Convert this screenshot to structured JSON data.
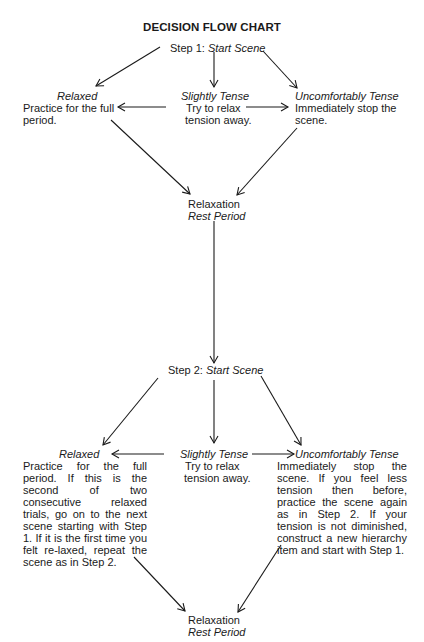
{
  "title": "DECISION FLOW CHART",
  "step1": {
    "label": "Step 1:",
    "action": "Start Scene",
    "relaxed": {
      "heading": "Relaxed",
      "text_line1": "Practice for the full",
      "text_line2": "period."
    },
    "slightly_tense": {
      "heading": "Slightly Tense",
      "text_line1": "Try to relax",
      "text_line2": "tension away."
    },
    "uncomfortably_tense": {
      "heading": "Uncomfortably Tense",
      "text_line1": "Immediately stop the",
      "text_line2": "scene."
    },
    "rest": {
      "line1": "Relaxation",
      "line2": "Rest Period"
    }
  },
  "step2": {
    "label": "Step 2:",
    "action": "Start Scene",
    "relaxed": {
      "heading": "Relaxed",
      "text": "Practice for the full period. If this is the second of two consecutive relaxed trials, go on to the next scene starting with Step 1. If it is the first time you felt re-laxed, repeat the scene as in Step 2."
    },
    "slightly_tense": {
      "heading": "Slightly Tense",
      "text_line1": "Try to relax",
      "text_line2": "tension away."
    },
    "uncomfortably_tense": {
      "heading": "Uncomfortably Tense",
      "text": "Immediately stop the scene. If you feel less tension then before, practice the scene again as in Step 2. If your tension is not diminished, construct a new hierarchy item and start with Step 1."
    },
    "rest": {
      "line1": "Relaxation",
      "line2": "Rest Period"
    }
  },
  "colors": {
    "ink": "#1a1a1a",
    "background": "#ffffff"
  }
}
